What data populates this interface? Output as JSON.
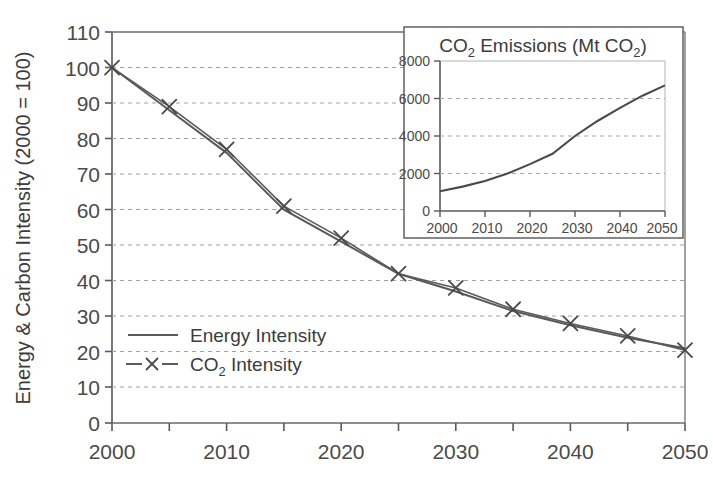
{
  "chart_data": [
    {
      "id": "main",
      "type": "line",
      "title": "",
      "xlabel": "",
      "ylabel": "Energy & Carbon Intensity (2000 = 100)",
      "xlim": [
        2000,
        2050
      ],
      "ylim": [
        0,
        110
      ],
      "x_ticks": [
        2000,
        2005,
        2010,
        2015,
        2020,
        2025,
        2030,
        2035,
        2040,
        2045,
        2050
      ],
      "x_tick_labels": [
        "2000",
        "",
        "2010",
        "",
        "2020",
        "",
        "2030",
        "",
        "2040",
        "",
        "2050"
      ],
      "x_tick_labels_shown": [
        "2000",
        "2010",
        "2020",
        "2030",
        "2040",
        "2050"
      ],
      "y_ticks": [
        0,
        10,
        20,
        30,
        40,
        50,
        60,
        70,
        80,
        90,
        100,
        110
      ],
      "y_tick_labels": [
        "0",
        "10",
        "20",
        "30",
        "40",
        "50",
        "60",
        "70",
        "80",
        "90",
        "100",
        "110"
      ],
      "grid": true,
      "grid_style": "dashed-horizontal",
      "legend_position": "inside-lower-left",
      "x": [
        2000,
        2005,
        2010,
        2015,
        2020,
        2025,
        2030,
        2035,
        2040,
        2045,
        2050
      ],
      "series": [
        {
          "name": "Energy Intensity",
          "marker": "none",
          "values": [
            100,
            88,
            76,
            60,
            51,
            42,
            37,
            31.5,
            27.5,
            24,
            21
          ]
        },
        {
          "name": "CO2 Intensity",
          "marker": "x",
          "values": [
            100,
            89,
            77,
            61,
            52,
            42,
            38,
            32,
            28,
            24.5,
            20.5
          ]
        }
      ],
      "legend": [
        {
          "label": "Energy Intensity",
          "marker": "line"
        },
        {
          "label": "CO2 Intensity",
          "label_prefix": "CO",
          "label_sub": "2",
          "label_suffix": " Intensity",
          "marker": "dash-x-dash"
        }
      ]
    },
    {
      "id": "inset",
      "type": "line",
      "title": "CO2 Emissions (Mt CO2)",
      "title_parts": [
        "CO",
        "2",
        " Emissions (Mt CO",
        "2",
        ")"
      ],
      "xlabel": "",
      "ylabel": "",
      "xlim": [
        2000,
        2050
      ],
      "ylim": [
        0,
        8000
      ],
      "x_ticks": [
        2000,
        2010,
        2020,
        2030,
        2040,
        2050
      ],
      "x_tick_labels": [
        "2000",
        "2010",
        "2020",
        "2030",
        "2040",
        "2050"
      ],
      "y_ticks": [
        0,
        2000,
        4000,
        6000,
        8000
      ],
      "y_tick_labels": [
        "0",
        "2000",
        "4000",
        "6000",
        "8000"
      ],
      "grid": true,
      "grid_style": "dashed-horizontal",
      "legend_position": "none",
      "x": [
        2000,
        2005,
        2010,
        2015,
        2020,
        2025,
        2030,
        2035,
        2040,
        2045,
        2050
      ],
      "series": [
        {
          "name": "CO2 Emissions",
          "marker": "none",
          "values": [
            1050,
            1300,
            1600,
            2000,
            2500,
            3050,
            4000,
            4800,
            5500,
            6150,
            6700
          ]
        }
      ]
    }
  ],
  "colors": {
    "line": "#4a4a4a",
    "axis": "#555555",
    "grid": "#9a9a9a",
    "text": "#3c3c3c",
    "background": "#ffffff"
  },
  "main_axis": {
    "y_title": "Energy & Carbon Intensity (2000 = 100)",
    "y_tick_labels": [
      "110",
      "100",
      "90",
      "80",
      "70",
      "60",
      "50",
      "40",
      "30",
      "20",
      "10",
      "0"
    ],
    "x_tick_labels": [
      "2000",
      "2010",
      "2020",
      "2030",
      "2040",
      "2050"
    ]
  },
  "legend": {
    "energy_label": "Energy Intensity",
    "co2_label_prefix": "CO",
    "co2_label_sub": "2",
    "co2_label_suffix": " Intensity"
  },
  "inset": {
    "title_prefix": "CO",
    "title_sub1": "2",
    "title_mid": " Emissions (Mt CO",
    "title_sub2": "2",
    "title_suffix": ")",
    "y_tick_labels": [
      "8000",
      "6000",
      "4000",
      "2000",
      "0"
    ],
    "x_tick_labels": [
      "2000",
      "2010",
      "2020",
      "2030",
      "2040",
      "2050"
    ]
  }
}
